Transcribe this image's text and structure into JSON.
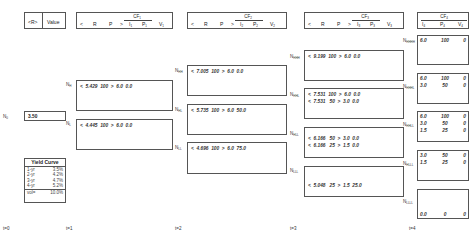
{
  "header": {
    "r_label": "<R>",
    "value_label": "Value",
    "cf_columns": [
      {
        "title": "CF",
        "index": "1",
        "cols": [
          "<",
          "R",
          "P",
          ">",
          "I",
          "P",
          "V"
        ],
        "sub": "1"
      },
      {
        "title": "CF",
        "index": "2",
        "cols": [
          "<",
          "R",
          "P",
          ">",
          "I",
          "P",
          "V"
        ],
        "sub": "2"
      },
      {
        "title": "CF",
        "index": "3",
        "cols": [
          "<",
          "R",
          "P",
          ">",
          "I",
          "P",
          "V"
        ],
        "sub": "3"
      },
      {
        "title": "CF",
        "index": "4",
        "cols": [
          "I",
          "P",
          "V"
        ],
        "sub": "4"
      }
    ]
  },
  "root": {
    "label": "N",
    "sub": "0",
    "value": "3.50"
  },
  "t1": [
    {
      "label": "N",
      "sub": "H",
      "rows": [
        {
          "r": "5.429",
          "p": "100",
          "i": "6.0",
          "v": "0.0"
        }
      ]
    },
    {
      "label": "N",
      "sub": "L",
      "rows": [
        {
          "r": "4.445",
          "p": "100",
          "i": "6.0",
          "v": "0.0"
        }
      ]
    }
  ],
  "t2": [
    {
      "label": "N",
      "sub": "HH",
      "rows": [
        {
          "r": "7.005",
          "p": "100",
          "i": "6.0",
          "v": "0.0"
        }
      ]
    },
    {
      "label": "N",
      "sub": "HL",
      "rows": [
        {
          "r": "5.735",
          "p": "100",
          "i": "6.0",
          "v": "50.0"
        }
      ]
    },
    {
      "label": "N",
      "sub": "LL",
      "rows": [
        {
          "r": "4.696",
          "p": "100",
          "i": "6.0",
          "v": "75.0"
        }
      ]
    }
  ],
  "t3": [
    {
      "label": "N",
      "sub": "HHH",
      "rows": [
        {
          "r": "9.199",
          "p": "100",
          "i": "6.0",
          "v": "0.0"
        }
      ]
    },
    {
      "label": "N",
      "sub": "HHL",
      "rows": [
        {
          "r": "7.531",
          "p": "100",
          "i": "6.0",
          "v": "0.0"
        },
        {
          "r": "7.531",
          "p": "50",
          "i": "3.0",
          "v": "0.0"
        }
      ]
    },
    {
      "label": "N",
      "sub": "HLL",
      "rows": [
        {
          "r": "6.166",
          "p": "50",
          "i": "3.0",
          "v": "0.0"
        },
        {
          "r": "6.166",
          "p": "25",
          "i": "1.5",
          "v": "0.0"
        }
      ]
    },
    {
      "label": "N",
      "sub": "LLL",
      "rows": [
        {
          "r": "5.048",
          "p": "25",
          "i": "1.5",
          "v": "25.0"
        }
      ]
    }
  ],
  "t4": [
    {
      "label": "N",
      "sub": "HHHH",
      "rows": [
        {
          "i": "6.0",
          "p": "100",
          "v": "0"
        }
      ]
    },
    {
      "label": "N",
      "sub": "HHHL",
      "rows": [
        {
          "i": "6.0",
          "p": "100",
          "v": "0"
        },
        {
          "i": "3.0",
          "p": "50",
          "v": "0"
        }
      ]
    },
    {
      "label": "N",
      "sub": "HHLL",
      "rows": [
        {
          "i": "6.0",
          "p": "100",
          "v": "0"
        },
        {
          "i": "3.0",
          "p": "50",
          "v": "0"
        },
        {
          "i": "1.5",
          "p": "25",
          "v": "0"
        }
      ]
    },
    {
      "label": "N",
      "sub": "HLLL",
      "rows": [
        {
          "i": "3.0",
          "p": "50",
          "v": "0"
        },
        {
          "i": "1.5",
          "p": "25",
          "v": "0"
        }
      ]
    },
    {
      "label": "N",
      "sub": "LLLL",
      "rows": [
        {
          "i": "0.0",
          "p": "0",
          "v": "0"
        }
      ]
    }
  ],
  "yield_curve": {
    "title": "Yield Curve",
    "rows": [
      {
        "term": "1-yr",
        "rate": "3.5%"
      },
      {
        "term": "2-yr",
        "rate": "4.2%"
      },
      {
        "term": "3-yr",
        "rate": "4.7%"
      },
      {
        "term": "4-yr",
        "rate": "5.2%"
      }
    ],
    "vol_label": "vol=",
    "vol_value": "10.0%"
  },
  "timeline": [
    "t=0",
    "t=1",
    "t=2",
    "t=3",
    "t=4"
  ]
}
